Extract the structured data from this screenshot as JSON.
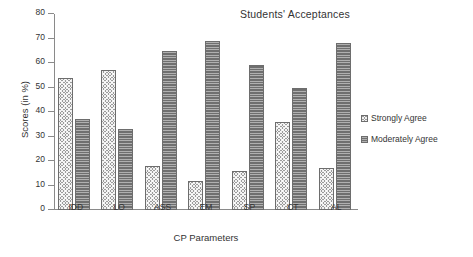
{
  "chart_data": {
    "type": "bar",
    "title": "Students' Acceptances",
    "xlabel": "CP Parameters",
    "ylabel": "Scores (in %)",
    "categories": [
      "IDD",
      "LO",
      "ASS",
      "EM",
      "SP",
      "CT",
      "AL"
    ],
    "series": [
      {
        "name": "Strongly Agree",
        "values": [
          54,
          57,
          18,
          12,
          16,
          36,
          17
        ],
        "color": "#9c9c9c",
        "pattern": "diagonal-crosshatch"
      },
      {
        "name": "Moderately Agree",
        "values": [
          37,
          33,
          65,
          69,
          59,
          50,
          68
        ],
        "color": "#6f6f6f",
        "pattern": "horizontal-lines"
      }
    ],
    "ylim": [
      0,
      80
    ],
    "yticks": [
      0,
      10,
      20,
      30,
      40,
      50,
      60,
      70,
      80
    ],
    "ytick_labels": [
      "0",
      "10",
      "20",
      "30",
      "40",
      "50",
      "60",
      "70",
      "80"
    ],
    "grid": false,
    "legend_position": "right"
  },
  "legend": {
    "items": [
      {
        "label": "Strongly Agree",
        "swatch": "strongly-agree-swatch"
      },
      {
        "label": "Moderately Agree",
        "swatch": "moderately-agree-swatch"
      }
    ]
  }
}
